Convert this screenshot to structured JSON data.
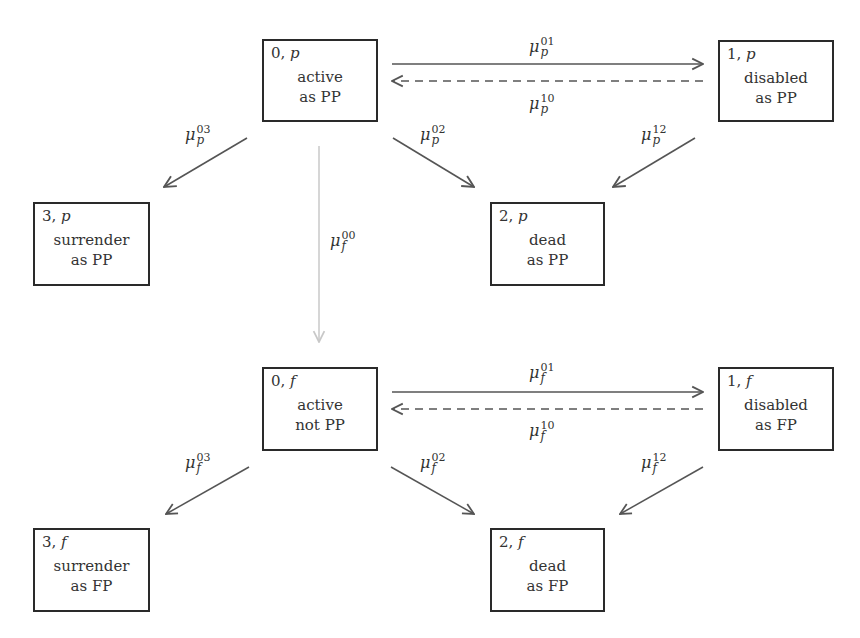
{
  "states": [
    {
      "key": "0p",
      "num": "0",
      "type": "p",
      "line1": "active",
      "line2": "as PP"
    },
    {
      "key": "1p",
      "num": "1",
      "type": "p",
      "line1": "disabled",
      "line2": "as PP"
    },
    {
      "key": "3p",
      "num": "3",
      "type": "p",
      "line1": "surrender",
      "line2": "as PP"
    },
    {
      "key": "2p",
      "num": "2",
      "type": "p",
      "line1": "dead",
      "line2": "as PP"
    },
    {
      "key": "0f",
      "num": "0",
      "type": "f",
      "line1": "active",
      "line2": "not PP"
    },
    {
      "key": "1f",
      "num": "1",
      "type": "f",
      "line1": "disabled",
      "line2": "as FP"
    },
    {
      "key": "3f",
      "num": "3",
      "type": "f",
      "line1": "surrender",
      "line2": "as FP"
    },
    {
      "key": "2f",
      "num": "2",
      "type": "f",
      "line1": "dead",
      "line2": "as FP"
    }
  ],
  "rates": [
    {
      "sym": "μ",
      "sub": "p",
      "sup": "01"
    },
    {
      "sym": "μ",
      "sub": "p",
      "sup": "10"
    },
    {
      "sym": "μ",
      "sub": "p",
      "sup": "03"
    },
    {
      "sym": "μ",
      "sub": "p",
      "sup": "02"
    },
    {
      "sym": "μ",
      "sub": "p",
      "sup": "12"
    },
    {
      "sym": "μ",
      "sub": "f",
      "sup": "00"
    },
    {
      "sym": "μ",
      "sub": "f",
      "sup": "01"
    },
    {
      "sym": "μ",
      "sub": "f",
      "sup": "10"
    },
    {
      "sym": "μ",
      "sub": "f",
      "sup": "03"
    },
    {
      "sym": "μ",
      "sub": "f",
      "sup": "02"
    },
    {
      "sym": "μ",
      "sub": "f",
      "sup": "12"
    }
  ],
  "colors": {
    "box_border": "#2a2a2a",
    "arrow": "#555555",
    "arrow_faint": "#c8c8c8",
    "text": "#333333"
  }
}
